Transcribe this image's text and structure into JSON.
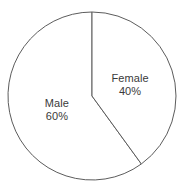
{
  "chart_data": {
    "type": "pie",
    "title": "",
    "subtitle": "",
    "xlabel": "",
    "ylabel": "",
    "categories": [
      "Male",
      "Female"
    ],
    "values": [
      60,
      40
    ],
    "value_unit": "%",
    "labels": [
      "Male 60%",
      "Female 40%"
    ],
    "legend": null,
    "legend_position": "none",
    "grid": false,
    "annotations": [],
    "slices": [
      {
        "name": "Male",
        "value": 60,
        "value_text": "60%",
        "start_angle_deg": 144,
        "end_angle_deg": 360,
        "sweep_deg": 216,
        "fill": "#ffffff",
        "stroke": "#5c5c5c",
        "label_x_pct": 30.8,
        "label_y_pct": 56.8
      },
      {
        "name": "Female",
        "value": 40,
        "value_text": "40%",
        "start_angle_deg": 0,
        "end_angle_deg": 144,
        "sweep_deg": 144,
        "fill": "#ffffff",
        "stroke": "#5c5c5c",
        "label_x_pct": 70.3,
        "label_y_pct": 43.8
      }
    ],
    "geometry": {
      "center_x": 92,
      "center_y": 96,
      "radius": 84,
      "start_angle_deg": 0,
      "direction": "clockwise"
    },
    "colors": {
      "background": "#ffffff",
      "outline": "#5c5c5c",
      "text": "#3a3a3a"
    }
  }
}
